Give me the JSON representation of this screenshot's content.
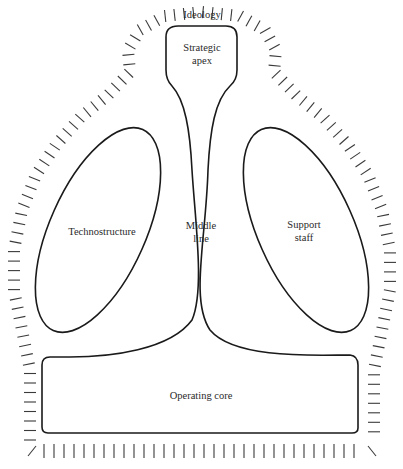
{
  "diagram": {
    "labels": {
      "ideology": "Ideology",
      "strategic_apex_line1": "Strategic",
      "strategic_apex_line2": "apex",
      "technostructure": "Technostructure",
      "middle_line_line1": "Middle",
      "middle_line_line2": "line",
      "support_staff_line1": "Support",
      "support_staff_line2": "staff",
      "operating_core": "Operating core"
    },
    "colors": {
      "stroke": "#1a1a1a",
      "hatch": "#3a3a3a",
      "text": "#2a2a2a",
      "background": "#ffffff"
    }
  }
}
